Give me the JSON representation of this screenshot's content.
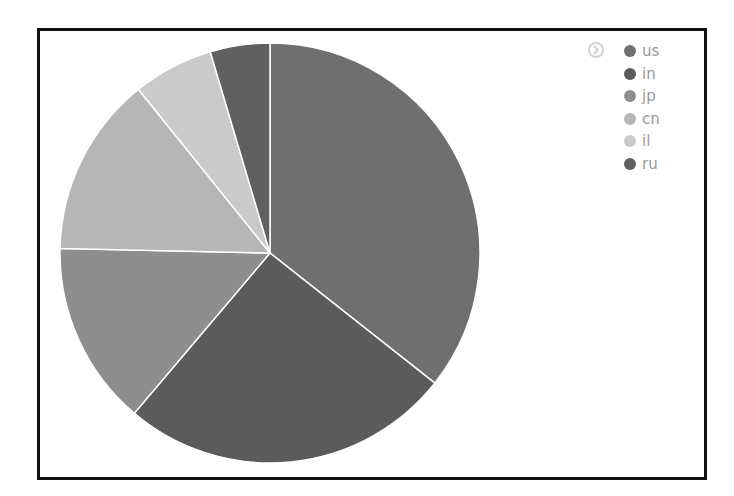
{
  "chart_data": {
    "type": "pie",
    "title": "",
    "categories": [
      "us",
      "in",
      "jp",
      "cn",
      "il",
      "ru"
    ],
    "values": [
      35.7,
      25.6,
      14.2,
      13.9,
      6.2,
      4.6
    ],
    "colors": [
      "#6f6f6f",
      "#5b5b5b",
      "#8e8e8e",
      "#b6b6b6",
      "#cacaca",
      "#606060"
    ],
    "start_angle": 0,
    "direction": "clockwise",
    "legend_position": "top-right",
    "legend": [
      "us",
      "in",
      "jp",
      "cn",
      "il",
      "ru"
    ]
  },
  "legend": {
    "items": [
      {
        "label": "us",
        "color": "#6f6f6f"
      },
      {
        "label": "in",
        "color": "#5b5b5b"
      },
      {
        "label": "jp",
        "color": "#8e8e8e"
      },
      {
        "label": "cn",
        "color": "#b6b6b6"
      },
      {
        "label": "il",
        "color": "#cacaca"
      },
      {
        "label": "ru",
        "color": "#606060"
      }
    ]
  }
}
